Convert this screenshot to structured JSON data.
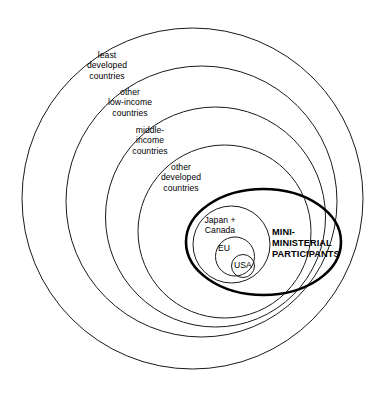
{
  "diagram": {
    "type": "concentric-venn",
    "title": "",
    "background_color": "#ffffff",
    "line_color": "#1a1a1a",
    "highlight_color": "#000000",
    "rings": [
      {
        "id": "least-developed",
        "label": "least\ndeveloped\ncountries",
        "order": 1,
        "emphasis": "normal"
      },
      {
        "id": "other-low-income",
        "label": "other\nlow-income\ncountries",
        "order": 2,
        "emphasis": "normal"
      },
      {
        "id": "middle-income",
        "label": "middle-\nincome\ncountries",
        "order": 3,
        "emphasis": "normal"
      },
      {
        "id": "other-developed",
        "label": "other\ndeveloped\ncountries",
        "order": 4,
        "emphasis": "normal"
      },
      {
        "id": "japan-canada",
        "label": "Japan +\nCanada",
        "order": 5,
        "emphasis": "normal"
      },
      {
        "id": "eu",
        "label": "EU",
        "order": 6,
        "emphasis": "normal"
      },
      {
        "id": "usa",
        "label": "USA",
        "order": 7,
        "emphasis": "normal"
      }
    ],
    "overlay": {
      "id": "mini-ministerial",
      "label": "MINI-\nMINISTERIAL\nPARTICIPANTS",
      "emphasis": "bold"
    }
  }
}
